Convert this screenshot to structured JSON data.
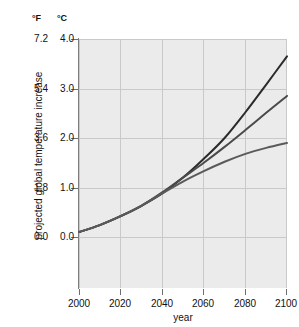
{
  "chart_data": {
    "type": "line",
    "title": "",
    "xlabel": "year",
    "ylabel": "projected global temperature increase",
    "x": [
      2000,
      2010,
      2020,
      2030,
      2040,
      2050,
      2060,
      2070,
      2080,
      2090,
      2100
    ],
    "xlim": [
      2000,
      2100
    ],
    "axes": [
      {
        "name": "fahrenheit",
        "unit_label": "°F",
        "ticks": [
          "7.2",
          "5.4",
          "3.6",
          "1.8",
          "0.0"
        ],
        "tick_values": [
          7.2,
          5.4,
          3.6,
          1.8,
          0.0
        ],
        "ylim": [
          0.0,
          7.2
        ]
      },
      {
        "name": "celsius",
        "unit_label": "°C",
        "ticks": [
          "4.0",
          "3.0",
          "2.0",
          "1.0",
          "0.0"
        ],
        "tick_values": [
          4.0,
          3.0,
          2.0,
          1.0,
          0.0
        ],
        "ylim": [
          0.0,
          4.0
        ]
      }
    ],
    "xticks": [
      "2000",
      "2020",
      "2040",
      "2060",
      "2080",
      "2100"
    ],
    "xtick_values": [
      2000,
      2020,
      2040,
      2060,
      2080,
      2100
    ],
    "grid": true,
    "legend": "none",
    "series": [
      {
        "name": "high-scenario",
        "color": "#2b2b2b",
        "values": [
          0.1,
          0.24,
          0.42,
          0.63,
          0.88,
          1.2,
          1.58,
          2.0,
          2.52,
          3.08,
          3.65
        ]
      },
      {
        "name": "mid-scenario",
        "color": "#4a4a4a",
        "values": [
          0.1,
          0.24,
          0.42,
          0.63,
          0.9,
          1.2,
          1.5,
          1.82,
          2.16,
          2.51,
          2.85
        ]
      },
      {
        "name": "low-scenario",
        "color": "#5a5a5a",
        "values": [
          0.1,
          0.24,
          0.42,
          0.63,
          0.88,
          1.12,
          1.33,
          1.52,
          1.68,
          1.8,
          1.9
        ]
      }
    ]
  },
  "labels": {
    "unit_f": "°F",
    "unit_c": "°C",
    "y_axis_title": "projected global temperature increase",
    "x_axis_title": "year"
  }
}
